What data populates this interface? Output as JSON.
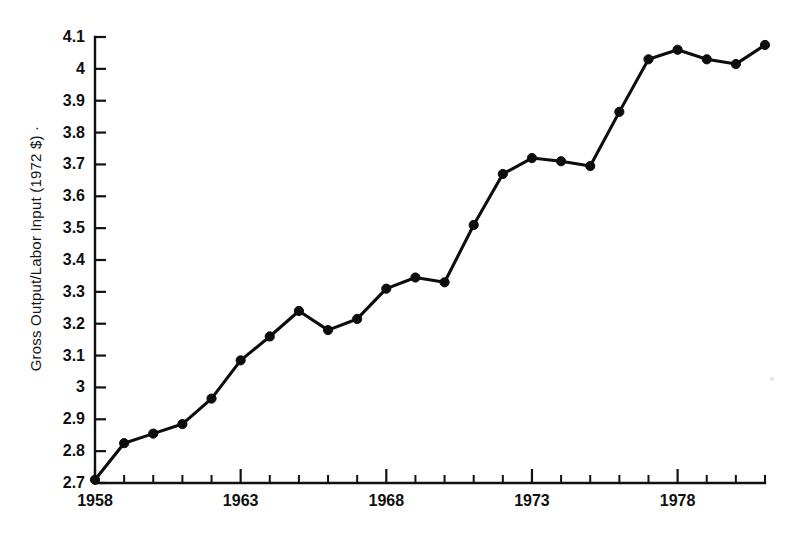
{
  "chart_data": {
    "type": "line",
    "title": "",
    "subtitle": "",
    "xlabel": "",
    "ylabel": "Gross Output/Labor Input (1972 $)",
    "ylabel_suffix_mark": "·",
    "x": [
      1958,
      1959,
      1960,
      1961,
      1962,
      1963,
      1964,
      1965,
      1966,
      1967,
      1968,
      1969,
      1970,
      1971,
      1972,
      1973,
      1974,
      1975,
      1976,
      1977,
      1978,
      1979,
      1980,
      1981
    ],
    "values": [
      2.71,
      2.825,
      2.855,
      2.885,
      2.965,
      3.085,
      3.16,
      3.24,
      3.18,
      3.215,
      3.31,
      3.345,
      3.33,
      3.51,
      3.67,
      3.72,
      3.71,
      3.695,
      3.865,
      4.03,
      4.06,
      4.03,
      4.015,
      4.075
    ],
    "series": [
      {
        "name": "Gross Output/Labor Input",
        "values": [
          2.71,
          2.825,
          2.855,
          2.885,
          2.965,
          3.085,
          3.16,
          3.24,
          3.18,
          3.215,
          3.31,
          3.345,
          3.33,
          3.51,
          3.67,
          3.72,
          3.71,
          3.695,
          3.865,
          4.03,
          4.06,
          4.03,
          4.015,
          4.075
        ],
        "color": "#0d0d0d",
        "marker": "filled-circle"
      }
    ],
    "xlim": [
      1958,
      1981
    ],
    "ylim": [
      2.7,
      4.1
    ],
    "ytick_labels": [
      "4.1",
      "4",
      "3.9",
      "3.8",
      "3.7",
      "3.6",
      "3.5",
      "3.4",
      "3.3",
      "3.2",
      "3.1",
      "3",
      "2.9",
      "2.8",
      "2.7"
    ],
    "ytick_values": [
      4.1,
      4.0,
      3.9,
      3.8,
      3.7,
      3.6,
      3.5,
      3.4,
      3.3,
      3.2,
      3.1,
      3.0,
      2.9,
      2.8,
      2.7
    ],
    "xtick_labels": [
      "1958",
      "1963",
      "1968",
      "1973",
      "1978"
    ],
    "xtick_values": [
      1958,
      1963,
      1968,
      1973,
      1978
    ],
    "xminor_tick_values": [
      1959,
      1960,
      1961,
      1962,
      1964,
      1965,
      1966,
      1967,
      1969,
      1970,
      1971,
      1972,
      1974,
      1975,
      1976,
      1977,
      1979,
      1980,
      1981
    ],
    "grid": false,
    "legend": false,
    "legend_position": "none",
    "annotations": [],
    "axis_color": "#111111",
    "background_color": "#ffffff",
    "axis_style": "left-and-bottom-spines-only"
  }
}
